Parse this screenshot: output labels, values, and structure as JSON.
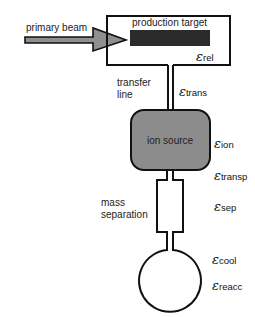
{
  "diagram": {
    "labels": {
      "primary_beam": "primary beam",
      "production_target": "production target",
      "transfer_line_1": "transfer",
      "transfer_line_2": "line",
      "ion_source": "ion source",
      "mass_separation_1": "mass",
      "mass_separation_2": "separation"
    },
    "efficiencies": [
      {
        "symbol": "ε",
        "sub": "rel"
      },
      {
        "symbol": "ε",
        "sub": "trans"
      },
      {
        "symbol": "ε",
        "sub": "ion"
      },
      {
        "symbol": "ε",
        "sub": "transp"
      },
      {
        "symbol": "ε",
        "sub": "sep"
      },
      {
        "symbol": "ε",
        "sub": "cool"
      },
      {
        "symbol": "ε",
        "sub": "reacc"
      }
    ],
    "colors": {
      "outline": "#111111",
      "target_bar": "#2b2b2b",
      "ion_source_fill": "#8c8c8c",
      "arrow_fill": "#8f8f8f"
    }
  }
}
